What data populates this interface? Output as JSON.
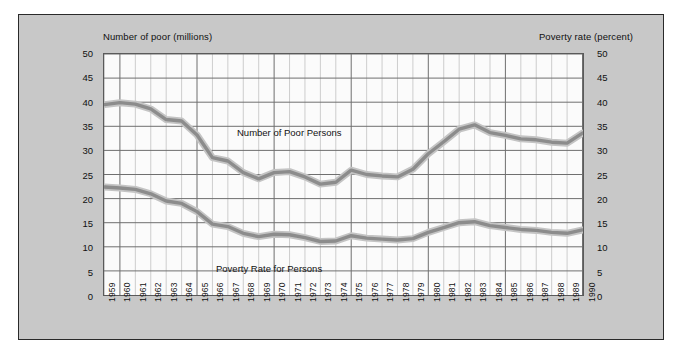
{
  "figure": {
    "left_axis_title": "Number of poor (millions)",
    "right_axis_title": "Poverty rate (percent)",
    "background_color": "#c8c8c8",
    "plot_background_color": "#fbfbfb",
    "line_color": "#8c8c8c",
    "grid_color": "#b9b9b9",
    "grid_major_color": "#6e6e6e"
  },
  "chart_data": {
    "type": "line",
    "title": "",
    "xlabel": "",
    "ylabel": "Number of poor (millions)",
    "y2label": "Poverty rate (percent)",
    "ylim": [
      0,
      50
    ],
    "y2lim": [
      0,
      50
    ],
    "yticks": [
      0,
      5,
      10,
      15,
      20,
      25,
      30,
      35,
      40,
      45,
      50
    ],
    "y2ticks": [
      0,
      5,
      10,
      15,
      20,
      25,
      30,
      35,
      40,
      45,
      50
    ],
    "grid": true,
    "legend_position": "inline-annotation",
    "x": [
      1959,
      1960,
      1961,
      1962,
      1963,
      1964,
      1965,
      1966,
      1967,
      1968,
      1969,
      1970,
      1971,
      1972,
      1973,
      1974,
      1975,
      1976,
      1977,
      1978,
      1979,
      1980,
      1981,
      1982,
      1983,
      1984,
      1985,
      1986,
      1987,
      1988,
      1989,
      1990
    ],
    "xticklabels": [
      "1959",
      "1960",
      "1961",
      "1962",
      "1963",
      "1964",
      "1965",
      "1966",
      "1967",
      "1968",
      "1969",
      "1970",
      "1971",
      "1972",
      "1973",
      "1974",
      "1975",
      "1976",
      "1977",
      "1978",
      "1979",
      "1980",
      "1981",
      "1982",
      "1983",
      "1984",
      "1985",
      "1986",
      "1987",
      "1988",
      "1989",
      "1990"
    ],
    "series": [
      {
        "name": "Number of Poor Persons",
        "axis": "left",
        "units": "millions",
        "annotation": "Number of Poor Persons",
        "values": [
          39.5,
          39.9,
          39.6,
          38.6,
          36.4,
          36.1,
          33.2,
          28.5,
          27.8,
          25.4,
          24.1,
          25.4,
          25.6,
          24.5,
          23.0,
          23.4,
          25.9,
          25.0,
          24.7,
          24.5,
          26.1,
          29.3,
          31.8,
          34.4,
          35.3,
          33.7,
          33.1,
          32.4,
          32.2,
          31.7,
          31.5,
          33.6
        ]
      },
      {
        "name": "Poverty Rate for Persons",
        "axis": "right",
        "units": "percent",
        "annotation": "Poverty Rate for Persons",
        "values": [
          22.4,
          22.2,
          21.9,
          21.0,
          19.5,
          19.0,
          17.3,
          14.7,
          14.2,
          12.8,
          12.1,
          12.6,
          12.5,
          11.9,
          11.1,
          11.2,
          12.3,
          11.8,
          11.6,
          11.4,
          11.7,
          13.0,
          14.0,
          15.0,
          15.2,
          14.4,
          14.0,
          13.6,
          13.4,
          13.0,
          12.8,
          13.5
        ]
      }
    ]
  }
}
